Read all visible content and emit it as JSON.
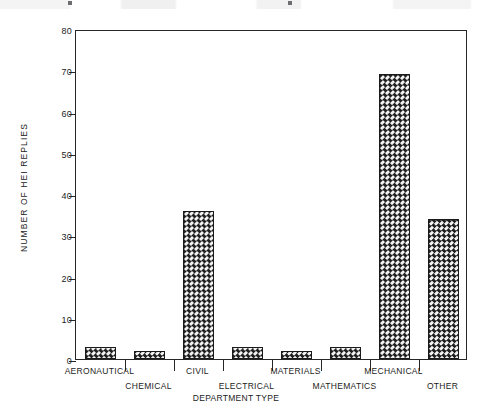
{
  "chart_data": {
    "type": "bar",
    "title": "",
    "xlabel": "DEPARTMENT TYPE",
    "ylabel": "NUMBER OF HEI REPLIES",
    "categories": [
      "AERONAUTICAL",
      "CHEMICAL",
      "CIVIL",
      "ELECTRICAL",
      "MATERIALS",
      "MATHEMATICS",
      "MECHANICAL",
      "OTHER"
    ],
    "values": [
      3,
      2,
      36,
      3,
      2,
      3,
      69,
      34
    ],
    "ylim": [
      0,
      80
    ],
    "ytick_labels": [
      "0",
      "10",
      "20",
      "30",
      "40",
      "50",
      "60",
      "70",
      "80"
    ],
    "ytick_values": [
      0,
      10,
      20,
      30,
      40,
      50,
      60,
      70,
      80
    ],
    "grid": false,
    "legend": null,
    "bar_fill": "checkerboard-crosshatch",
    "bar_edge_color": "#1a1a1a",
    "frame_color": "#262626",
    "background": "#ffffff",
    "xtick_label_stagger": [
      0,
      1,
      0,
      1,
      0,
      1,
      0,
      1
    ]
  }
}
